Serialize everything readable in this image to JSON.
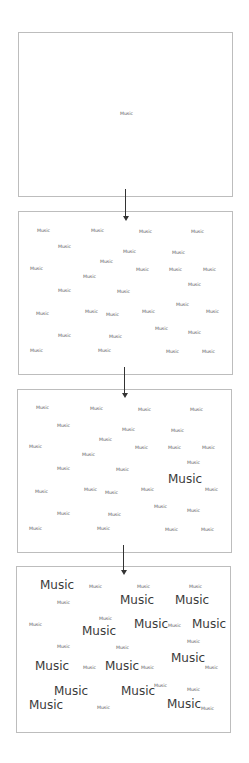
{
  "word": "Music",
  "colors": {
    "border": "#bdbdbd",
    "text": "#555555",
    "large_text": "#3a3a3a",
    "arrow": "#333333"
  },
  "panels": [
    {
      "id": "stage-1",
      "box": {
        "x": 18,
        "y": 32,
        "w": 215,
        "h": 165
      },
      "words": [
        {
          "x": 120,
          "y": 112,
          "size": "s"
        }
      ]
    },
    {
      "id": "stage-2",
      "box": {
        "x": 18,
        "y": 211,
        "w": 215,
        "h": 164
      },
      "words": [
        {
          "x": 37,
          "y": 229,
          "size": "s"
        },
        {
          "x": 91,
          "y": 229,
          "size": "s"
        },
        {
          "x": 139,
          "y": 230,
          "size": "s"
        },
        {
          "x": 191,
          "y": 230,
          "size": "s"
        },
        {
          "x": 58,
          "y": 245,
          "size": "s"
        },
        {
          "x": 123,
          "y": 250,
          "size": "s"
        },
        {
          "x": 172,
          "y": 251,
          "size": "s"
        },
        {
          "x": 100,
          "y": 260,
          "size": "s"
        },
        {
          "x": 30,
          "y": 267,
          "size": "s"
        },
        {
          "x": 136,
          "y": 268,
          "size": "s"
        },
        {
          "x": 169,
          "y": 268,
          "size": "s"
        },
        {
          "x": 203,
          "y": 268,
          "size": "s"
        },
        {
          "x": 83,
          "y": 275,
          "size": "s"
        },
        {
          "x": 188,
          "y": 283,
          "size": "s"
        },
        {
          "x": 58,
          "y": 289,
          "size": "s"
        },
        {
          "x": 117,
          "y": 290,
          "size": "s"
        },
        {
          "x": 176,
          "y": 303,
          "size": "s"
        },
        {
          "x": 36,
          "y": 312,
          "size": "s"
        },
        {
          "x": 85,
          "y": 310,
          "size": "s"
        },
        {
          "x": 106,
          "y": 313,
          "size": "s"
        },
        {
          "x": 142,
          "y": 310,
          "size": "s"
        },
        {
          "x": 206,
          "y": 310,
          "size": "s"
        },
        {
          "x": 155,
          "y": 327,
          "size": "s"
        },
        {
          "x": 188,
          "y": 331,
          "size": "s"
        },
        {
          "x": 58,
          "y": 334,
          "size": "s"
        },
        {
          "x": 109,
          "y": 335,
          "size": "s"
        },
        {
          "x": 30,
          "y": 349,
          "size": "s"
        },
        {
          "x": 98,
          "y": 349,
          "size": "s"
        },
        {
          "x": 166,
          "y": 350,
          "size": "s"
        },
        {
          "x": 202,
          "y": 350,
          "size": "s"
        }
      ]
    },
    {
      "id": "stage-3",
      "box": {
        "x": 17,
        "y": 389,
        "w": 215,
        "h": 164
      },
      "words": [
        {
          "x": 36,
          "y": 406,
          "size": "s"
        },
        {
          "x": 90,
          "y": 407,
          "size": "s"
        },
        {
          "x": 138,
          "y": 408,
          "size": "s"
        },
        {
          "x": 190,
          "y": 408,
          "size": "s"
        },
        {
          "x": 57,
          "y": 424,
          "size": "s"
        },
        {
          "x": 122,
          "y": 428,
          "size": "s"
        },
        {
          "x": 171,
          "y": 429,
          "size": "s"
        },
        {
          "x": 99,
          "y": 438,
          "size": "s"
        },
        {
          "x": 29,
          "y": 445,
          "size": "s"
        },
        {
          "x": 135,
          "y": 446,
          "size": "s"
        },
        {
          "x": 168,
          "y": 446,
          "size": "s"
        },
        {
          "x": 202,
          "y": 446,
          "size": "s"
        },
        {
          "x": 82,
          "y": 453,
          "size": "s"
        },
        {
          "x": 187,
          "y": 461,
          "size": "s"
        },
        {
          "x": 57,
          "y": 467,
          "size": "s"
        },
        {
          "x": 116,
          "y": 468,
          "size": "s"
        },
        {
          "x": 168,
          "y": 473,
          "size": "l"
        },
        {
          "x": 35,
          "y": 490,
          "size": "s"
        },
        {
          "x": 84,
          "y": 488,
          "size": "s"
        },
        {
          "x": 105,
          "y": 491,
          "size": "s"
        },
        {
          "x": 141,
          "y": 488,
          "size": "s"
        },
        {
          "x": 205,
          "y": 488,
          "size": "s"
        },
        {
          "x": 154,
          "y": 505,
          "size": "s"
        },
        {
          "x": 187,
          "y": 509,
          "size": "s"
        },
        {
          "x": 57,
          "y": 512,
          "size": "s"
        },
        {
          "x": 108,
          "y": 513,
          "size": "s"
        },
        {
          "x": 29,
          "y": 527,
          "size": "s"
        },
        {
          "x": 97,
          "y": 527,
          "size": "s"
        },
        {
          "x": 165,
          "y": 528,
          "size": "s"
        },
        {
          "x": 201,
          "y": 528,
          "size": "s"
        }
      ]
    },
    {
      "id": "stage-4",
      "box": {
        "x": 16,
        "y": 566,
        "w": 215,
        "h": 167
      },
      "words": [
        {
          "x": 40,
          "y": 579,
          "size": "l"
        },
        {
          "x": 89,
          "y": 585,
          "size": "s"
        },
        {
          "x": 137,
          "y": 585,
          "size": "s"
        },
        {
          "x": 189,
          "y": 585,
          "size": "s"
        },
        {
          "x": 57,
          "y": 601,
          "size": "s"
        },
        {
          "x": 120,
          "y": 594,
          "size": "l"
        },
        {
          "x": 175,
          "y": 594,
          "size": "l"
        },
        {
          "x": 99,
          "y": 617,
          "size": "s"
        },
        {
          "x": 29,
          "y": 623,
          "size": "s"
        },
        {
          "x": 134,
          "y": 618,
          "size": "l"
        },
        {
          "x": 168,
          "y": 624,
          "size": "s"
        },
        {
          "x": 192,
          "y": 618,
          "size": "l"
        },
        {
          "x": 82,
          "y": 625,
          "size": "l"
        },
        {
          "x": 187,
          "y": 640,
          "size": "s"
        },
        {
          "x": 57,
          "y": 645,
          "size": "s"
        },
        {
          "x": 116,
          "y": 646,
          "size": "s"
        },
        {
          "x": 171,
          "y": 652,
          "size": "l"
        },
        {
          "x": 35,
          "y": 660,
          "size": "l"
        },
        {
          "x": 83,
          "y": 666,
          "size": "s"
        },
        {
          "x": 105,
          "y": 660,
          "size": "l"
        },
        {
          "x": 141,
          "y": 666,
          "size": "s"
        },
        {
          "x": 205,
          "y": 666,
          "size": "s"
        },
        {
          "x": 154,
          "y": 684,
          "size": "s"
        },
        {
          "x": 187,
          "y": 688,
          "size": "s"
        },
        {
          "x": 54,
          "y": 685,
          "size": "l"
        },
        {
          "x": 121,
          "y": 685,
          "size": "l"
        },
        {
          "x": 29,
          "y": 699,
          "size": "l"
        },
        {
          "x": 97,
          "y": 706,
          "size": "s"
        },
        {
          "x": 167,
          "y": 698,
          "size": "l"
        },
        {
          "x": 201,
          "y": 707,
          "size": "s"
        }
      ]
    }
  ],
  "arrows": [
    {
      "x": 125,
      "y1": 189,
      "y2": 221
    },
    {
      "x": 124,
      "y1": 367,
      "y2": 398
    },
    {
      "x": 123,
      "y1": 545,
      "y2": 575
    }
  ]
}
